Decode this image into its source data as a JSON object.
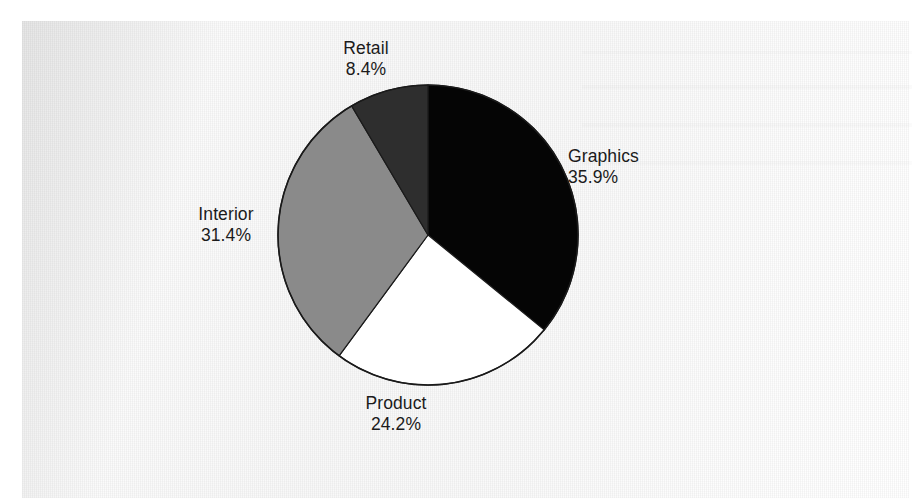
{
  "figure": {
    "background_color": "#ffffff",
    "page_color": "#ededed",
    "media": "scanned-print"
  },
  "chart_data": {
    "type": "pie",
    "title": "",
    "subtitle": "",
    "xlabel": "",
    "ylabel": "",
    "legend_position": "none",
    "labels_position": "outside",
    "start_angle_deg": 0,
    "direction": "clockwise",
    "categories": [
      "Graphics",
      "Product",
      "Interior",
      "Retail"
    ],
    "values": [
      35.9,
      24.2,
      31.4,
      8.4
    ],
    "value_suffix": "%",
    "colors": [
      "#050505",
      "#ffffff",
      "#8a8a8a",
      "#2e2e2e"
    ],
    "edge_color": "#1a1a1a",
    "slices": [
      {
        "name": "Graphics",
        "value": 35.9,
        "label_name": "Graphics",
        "label_value": "35.9%",
        "color": "#050505",
        "start_deg": 0,
        "end_deg": 129.24
      },
      {
        "name": "Product",
        "value": 24.2,
        "label_name": "Product",
        "label_value": "24.2%",
        "color": "#ffffff",
        "start_deg": 129.24,
        "end_deg": 216.36
      },
      {
        "name": "Interior",
        "value": 31.4,
        "label_name": "Interior",
        "label_value": "31.4%",
        "color": "#8a8a8a",
        "start_deg": 216.36,
        "end_deg": 329.4
      },
      {
        "name": "Retail",
        "value": 8.4,
        "label_name": "Retail",
        "label_value": "8.4%",
        "color": "#2e2e2e",
        "start_deg": 329.4,
        "end_deg": 360
      }
    ],
    "geometry": {
      "center_x": 428,
      "center_y": 235,
      "radius": 150
    }
  }
}
